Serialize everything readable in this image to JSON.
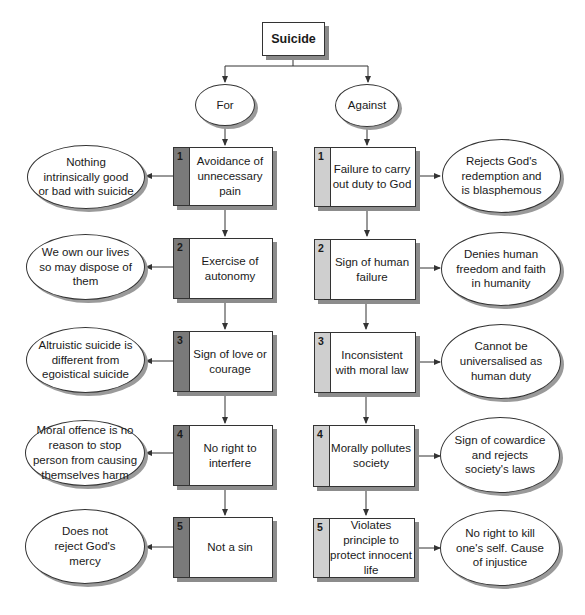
{
  "title": "Suicide",
  "colors": {
    "for_strip": "#7a7a7a",
    "against_strip": "#cfcfcf",
    "line": "#333333"
  },
  "branches": {
    "for": {
      "label": "For",
      "items": [
        {
          "number": "1",
          "argument": "Avoidance of unnecessary pain",
          "consequence": "Nothing intrinsically good or bad with suicide"
        },
        {
          "number": "2",
          "argument": "Exercise of autonomy",
          "consequence": "We own our lives so may dispose of them"
        },
        {
          "number": "3",
          "argument": "Sign of love or courage",
          "consequence": "Altruistic suicide is different from egoistical suicide"
        },
        {
          "number": "4",
          "argument": "No right to interfere",
          "consequence": "Moral offence is no reason to stop person from causing themselves harm"
        },
        {
          "number": "5",
          "argument": "Not a sin",
          "consequence": "Does not reject God's mercy"
        }
      ]
    },
    "against": {
      "label": "Against",
      "items": [
        {
          "number": "1",
          "argument": "Failure to carry out duty to God",
          "consequence": "Rejects God's redemption and is blasphemous"
        },
        {
          "number": "2",
          "argument": "Sign of human failure",
          "consequence": "Denies human freedom and faith in humanity"
        },
        {
          "number": "3",
          "argument": "Inconsistent with moral law",
          "consequence": "Cannot be universalised as human duty"
        },
        {
          "number": "4",
          "argument": "Morally pollutes society",
          "consequence": "Sign of cowardice and rejects society's laws"
        },
        {
          "number": "5",
          "argument": "Violates principle to protect innocent life",
          "consequence": "No right to kill one's self. Cause of injustice"
        }
      ]
    }
  }
}
